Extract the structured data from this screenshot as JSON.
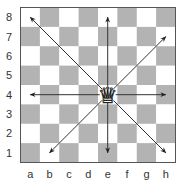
{
  "board": {
    "x": 20.5,
    "y": 7.5,
    "size": 155,
    "light_color": "#ffffff",
    "dark_color": "#b3b3b3",
    "border_color": "#555555",
    "ranks": [
      "8",
      "7",
      "6",
      "5",
      "4",
      "3",
      "2",
      "1"
    ],
    "files": [
      "a",
      "b",
      "c",
      "d",
      "e",
      "f",
      "g",
      "h"
    ]
  },
  "piece": {
    "name": "white-queen",
    "glyph": "♕",
    "square": "e4",
    "color": "#ffffff",
    "outline": "#222222"
  },
  "arrows": {
    "color": "#333333",
    "from": "e4",
    "targets": [
      {
        "dir": "up",
        "to": "e8"
      },
      {
        "dir": "down",
        "to": "e1"
      },
      {
        "dir": "left",
        "to": "a4"
      },
      {
        "dir": "right",
        "to": "h4"
      },
      {
        "dir": "up-left",
        "to": "a8"
      },
      {
        "dir": "up-right",
        "to": "h7"
      },
      {
        "dir": "down-left",
        "to": "b1"
      },
      {
        "dir": "down-right",
        "to": "h1"
      }
    ]
  }
}
